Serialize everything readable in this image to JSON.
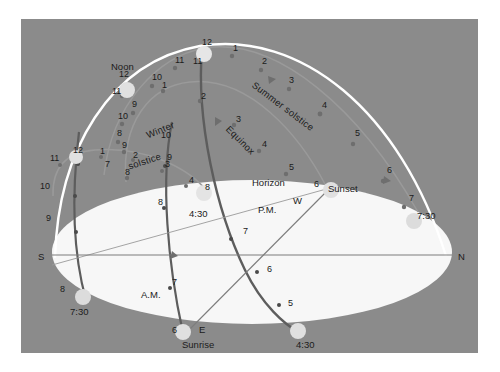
{
  "figure": {
    "background_color": "#8b8b8b",
    "horizon_plane_color": "#f7f7f7",
    "panel": {
      "x": 21,
      "y": 19,
      "width": 457,
      "height": 334
    }
  },
  "cardinals": [
    {
      "name": "south",
      "label": "S",
      "x": 38,
      "y": 252
    },
    {
      "name": "north",
      "label": "N",
      "x": 458,
      "y": 252
    },
    {
      "name": "east",
      "label": "E",
      "x": 199,
      "y": 325
    },
    {
      "name": "west",
      "label": "W",
      "x": 293,
      "y": 196
    }
  ],
  "curve_labels": [
    {
      "name": "summer-solstice",
      "label": "Summer solstice",
      "color": "#6f6f6f"
    },
    {
      "name": "equinox",
      "label": "Equinox",
      "color": "#6f6f6f"
    },
    {
      "name": "winter-solstice-line1",
      "label": "Winter",
      "color": "#4a4a4a"
    },
    {
      "name": "winter-solstice-line2",
      "label": "solstice",
      "color": "#4a4a4a"
    },
    {
      "name": "horizon",
      "label": "Horizon",
      "color": "#1b1b1b"
    },
    {
      "name": "meridian-noon",
      "label": "Noon",
      "color": "#1b1b1b"
    }
  ],
  "events": [
    {
      "name": "sunrise",
      "label": "Sunrise",
      "x": 182,
      "y": 340
    },
    {
      "name": "sunset",
      "label": "Sunset",
      "x": 328,
      "y": 184
    },
    {
      "name": "am-half",
      "label": "A.M.",
      "x": 141,
      "y": 290
    },
    {
      "name": "pm-half",
      "label": "P.M.",
      "x": 258,
      "y": 205
    }
  ],
  "extreme_times": [
    {
      "name": "summer-sunset-time",
      "label": "7:30",
      "x": 417,
      "y": 211
    },
    {
      "name": "summer-sunrise-time",
      "label": "7:30",
      "x": 70,
      "y": 307
    },
    {
      "name": "winter-sunset-time-west",
      "label": "4:30",
      "x": 189,
      "y": 209
    },
    {
      "name": "winter-sunset-time-east",
      "label": "4:30",
      "x": 296,
      "y": 340
    }
  ],
  "summer_solstice_hours": [
    {
      "label": "12",
      "x": 202,
      "y": 38
    },
    {
      "label": "1",
      "x": 233,
      "y": 44
    },
    {
      "label": "2",
      "x": 262,
      "y": 57
    },
    {
      "label": "3",
      "x": 289,
      "y": 76
    },
    {
      "label": "4",
      "x": 322,
      "y": 101
    },
    {
      "label": "5",
      "x": 355,
      "y": 129
    },
    {
      "label": "6",
      "x": 387,
      "y": 166
    },
    {
      "label": "7",
      "x": 409,
      "y": 194
    },
    {
      "label": "11",
      "x": 175,
      "y": 56
    },
    {
      "label": "10",
      "x": 152,
      "y": 73
    },
    {
      "label": "9",
      "x": 132,
      "y": 100
    },
    {
      "label": "8",
      "x": 117,
      "y": 129
    },
    {
      "label": "7",
      "x": 105,
      "y": 160
    }
  ],
  "equinox_hours": [
    {
      "label": "12",
      "x": 119,
      "y": 70
    },
    {
      "label": "1",
      "x": 162,
      "y": 81
    },
    {
      "label": "2",
      "x": 201,
      "y": 92
    },
    {
      "label": "3",
      "x": 236,
      "y": 115
    },
    {
      "label": "4",
      "x": 262,
      "y": 140
    },
    {
      "label": "5",
      "x": 289,
      "y": 163
    },
    {
      "label": "6",
      "x": 314,
      "y": 180
    },
    {
      "label": "11",
      "x": 112,
      "y": 87
    },
    {
      "label": "10",
      "x": 118,
      "y": 112
    },
    {
      "label": "9",
      "x": 122,
      "y": 141
    },
    {
      "label": "8",
      "x": 125,
      "y": 168
    }
  ],
  "winter_solstice_hours": [
    {
      "label": "12",
      "x": 73,
      "y": 146
    },
    {
      "label": "1",
      "x": 100,
      "y": 147
    },
    {
      "label": "2",
      "x": 133,
      "y": 151
    },
    {
      "label": "3",
      "x": 165,
      "y": 160
    },
    {
      "label": "4",
      "x": 189,
      "y": 176
    },
    {
      "label": "11",
      "x": 50,
      "y": 154
    },
    {
      "label": "10",
      "x": 40,
      "y": 182
    },
    {
      "label": "9",
      "x": 46,
      "y": 214
    },
    {
      "label": "8",
      "x": 60,
      "y": 285
    }
  ],
  "am_track_hours": [
    {
      "label": "10",
      "x": 161,
      "y": 131
    },
    {
      "label": "9",
      "x": 167,
      "y": 153
    },
    {
      "label": "8",
      "x": 158,
      "y": 198
    },
    {
      "label": "7",
      "x": 172,
      "y": 278
    },
    {
      "label": "6",
      "x": 172,
      "y": 326
    }
  ],
  "pm_track_hours": [
    {
      "label": "11",
      "x": 193,
      "y": 57
    },
    {
      "label": "8",
      "x": 205,
      "y": 183
    },
    {
      "label": "7",
      "x": 243,
      "y": 227
    },
    {
      "label": "6",
      "x": 267,
      "y": 265
    },
    {
      "label": "5",
      "x": 288,
      "y": 299
    }
  ],
  "colors": {
    "meridian": "#ffffff",
    "summer_path": "#8e8e8e",
    "equinox_path": "#8e8e8e",
    "winter_path": "#8e8e8e",
    "am_pm_track": "#5a5a5a",
    "dot": "#e2e2e2",
    "small_dot": "#707070",
    "horizon_line": "#7d7d7d"
  }
}
